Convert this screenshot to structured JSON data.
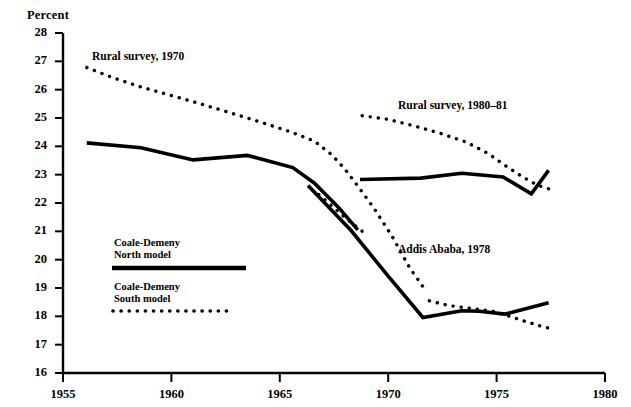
{
  "figure": {
    "y_axis_title": "Percent",
    "background_color": "#ffffff",
    "line_color": "#000000"
  },
  "axes": {
    "y_ticks": [
      "28",
      "27",
      "26",
      "25",
      "24",
      "23",
      "22",
      "21",
      "20",
      "19",
      "18",
      "17",
      "16"
    ],
    "x_ticks": [
      "1955",
      "1960",
      "1965",
      "1970",
      "1975",
      "1980"
    ]
  },
  "annotations": {
    "rural_1970": "Rural survey, 1970",
    "rural_1980_81": "Rural survey, 1980–81",
    "addis_ababa_1978": "Addis Ababa, 1978"
  },
  "legend": {
    "north_line1": "Coale-Demeny",
    "north_line2": "North model",
    "south_line1": "Coale-Demeny",
    "south_line2": "South model"
  },
  "chart_data": {
    "type": "line",
    "title": "",
    "xlabel": "",
    "ylabel": "Percent",
    "xlim": [
      1955,
      1980
    ],
    "ylim": [
      16,
      28
    ],
    "grid": false,
    "legend_position": "inside-left",
    "x_ticks": [
      1955,
      1960,
      1965,
      1970,
      1975,
      1980
    ],
    "y_ticks": [
      16,
      17,
      18,
      19,
      20,
      21,
      22,
      23,
      24,
      25,
      26,
      27,
      28
    ],
    "series": [
      {
        "name": "Rural survey, 1970 — Coale-Demeny South model",
        "style": "dotted",
        "points": [
          [
            1956.1,
            26.78
          ],
          [
            1957.2,
            26.45
          ],
          [
            1958.4,
            26.14
          ],
          [
            1959.6,
            25.88
          ],
          [
            1960.8,
            25.62
          ],
          [
            1962.0,
            25.35
          ],
          [
            1963.3,
            25.05
          ],
          [
            1964.5,
            24.76
          ],
          [
            1965.6,
            24.48
          ],
          [
            1966.6,
            24.18
          ],
          [
            1967.4,
            23.7
          ],
          [
            1968.0,
            23.2
          ],
          [
            1968.6,
            22.6
          ],
          [
            1969.4,
            21.75
          ],
          [
            1970.2,
            20.8
          ],
          [
            1971.0,
            19.7
          ],
          [
            1971.6,
            19.05
          ]
        ]
      },
      {
        "name": "Rural survey, 1970 — Coale-Demeny North model",
        "style": "solid",
        "points": [
          [
            1956.1,
            24.12
          ],
          [
            1958.6,
            23.95
          ],
          [
            1961.0,
            23.52
          ],
          [
            1963.5,
            23.68
          ],
          [
            1965.6,
            23.25
          ],
          [
            1966.6,
            22.7
          ],
          [
            1967.7,
            21.85
          ],
          [
            1968.6,
            21.05
          ]
        ]
      },
      {
        "name": "Rural survey, 1980–81 — Coale-Demeny South model",
        "style": "dotted",
        "points": [
          [
            1968.8,
            25.08
          ],
          [
            1970.0,
            24.95
          ],
          [
            1971.2,
            24.72
          ],
          [
            1972.4,
            24.46
          ],
          [
            1973.6,
            24.15
          ],
          [
            1974.6,
            23.75
          ],
          [
            1975.4,
            23.32
          ],
          [
            1976.2,
            22.92
          ],
          [
            1976.9,
            22.62
          ],
          [
            1977.4,
            22.5
          ]
        ]
      },
      {
        "name": "Rural survey, 1980–81 — Coale-Demeny North model",
        "style": "solid",
        "points": [
          [
            1968.7,
            22.83
          ],
          [
            1971.5,
            22.88
          ],
          [
            1973.4,
            23.05
          ],
          [
            1975.3,
            22.92
          ],
          [
            1976.6,
            22.32
          ],
          [
            1977.4,
            23.15
          ]
        ]
      },
      {
        "name": "Addis Ababa, 1978 — Coale-Demeny North model",
        "style": "solid",
        "points": [
          [
            1966.3,
            22.62
          ],
          [
            1968.3,
            21.02
          ],
          [
            1970.0,
            19.42
          ],
          [
            1971.6,
            17.96
          ],
          [
            1973.4,
            18.2
          ],
          [
            1974.2,
            18.18
          ],
          [
            1975.4,
            18.08
          ],
          [
            1977.4,
            18.48
          ]
        ]
      },
      {
        "name": "Addis Ababa, 1978 — Coale-Demeny South model (upper stub)",
        "style": "dotted",
        "points": [
          [
            1966.8,
            22.3
          ],
          [
            1967.4,
            21.9
          ],
          [
            1968.1,
            21.42
          ],
          [
            1968.8,
            21.0
          ]
        ]
      },
      {
        "name": "Addis Ababa, 1978 — Coale-Demeny South model",
        "style": "dotted",
        "points": [
          [
            1971.9,
            18.55
          ],
          [
            1972.8,
            18.38
          ],
          [
            1973.8,
            18.28
          ],
          [
            1974.8,
            18.18
          ],
          [
            1975.6,
            18.0
          ],
          [
            1976.4,
            17.8
          ],
          [
            1977.2,
            17.62
          ],
          [
            1977.6,
            17.55
          ]
        ]
      }
    ]
  }
}
